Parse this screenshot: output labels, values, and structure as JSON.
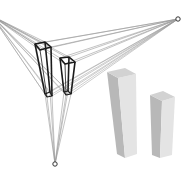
{
  "diagram": {
    "type": "three-point-perspective",
    "canvas": {
      "width": 189,
      "height": 174
    },
    "colors": {
      "background": "#ffffff",
      "construction_line": "#9a9a9a",
      "wireframe": "#1a1a1a",
      "vanishing_point": "#333333",
      "box_front": "#e4e4e4",
      "box_side": "#b8b8b8",
      "box_top": "#d2d2d2"
    },
    "vanishing_points": [
      {
        "id": "vp-left",
        "x": -8,
        "y": 16
      },
      {
        "id": "vp-right",
        "x": 178,
        "y": 19
      },
      {
        "id": "vp-bottom",
        "x": 55,
        "y": 164
      }
    ],
    "wireframe_boxes": [
      {
        "id": "wire-tall",
        "top": [
          [
            35,
            44
          ],
          [
            45,
            42
          ],
          [
            51,
            47
          ],
          [
            40,
            50
          ]
        ],
        "bottom": [
          [
            45,
            94
          ],
          [
            50,
            92
          ],
          [
            52,
            96
          ],
          [
            47,
            97
          ]
        ]
      },
      {
        "id": "wire-short",
        "top": [
          [
            60,
            58
          ],
          [
            69,
            57
          ],
          [
            75,
            62
          ],
          [
            65,
            64
          ]
        ],
        "bottom": [
          [
            64,
            92
          ],
          [
            68,
            91
          ],
          [
            71,
            94
          ],
          [
            66,
            95
          ]
        ]
      }
    ],
    "solid_boxes": [
      {
        "id": "solid-tall",
        "top": [
          [
            107,
            72
          ],
          [
            125,
            68
          ],
          [
            136,
            74
          ],
          [
            118,
            78
          ]
        ],
        "left_face": [
          [
            107,
            72
          ],
          [
            118,
            78
          ],
          [
            125,
            158
          ],
          [
            117,
            154
          ]
        ],
        "right_face": [
          [
            118,
            78
          ],
          [
            136,
            74
          ],
          [
            137,
            154
          ],
          [
            125,
            158
          ]
        ]
      },
      {
        "id": "solid-short",
        "top": [
          [
            150,
            95
          ],
          [
            163,
            91
          ],
          [
            175,
            97
          ],
          [
            162,
            101
          ]
        ],
        "left_face": [
          [
            150,
            95
          ],
          [
            162,
            101
          ],
          [
            160,
            158
          ],
          [
            152,
            155
          ]
        ],
        "right_face": [
          [
            162,
            101
          ],
          [
            175,
            97
          ],
          [
            172,
            155
          ],
          [
            160,
            158
          ]
        ]
      }
    ]
  }
}
